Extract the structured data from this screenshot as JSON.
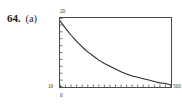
{
  "exercise": {
    "number": "64.",
    "part": "(a)"
  },
  "figure": {
    "y_axis": {
      "max_label": "20",
      "min_label": "10"
    },
    "x_axis": {
      "min_label": "0",
      "max_label": "500"
    },
    "colors": {
      "frame": "#4a4a4a",
      "curve": "#2a2a2a",
      "text": "#1a1a1a",
      "background": "#ffffff"
    }
  },
  "chart_data": {
    "type": "line",
    "title": "",
    "xlabel": "",
    "ylabel": "",
    "xlim": [
      0,
      500
    ],
    "ylim": [
      10,
      20
    ],
    "grid": false,
    "legend": null,
    "x": [
      0,
      25,
      50,
      75,
      100,
      125,
      150,
      175,
      200,
      225,
      250,
      275,
      300,
      325,
      350,
      375,
      400,
      425,
      450,
      475,
      500
    ],
    "y": [
      19.6,
      18.5,
      17.5,
      16.6,
      15.8,
      15.1,
      14.5,
      13.9,
      13.4,
      13.0,
      12.6,
      12.2,
      11.9,
      11.6,
      11.4,
      11.2,
      11.0,
      10.8,
      10.6,
      10.5,
      10.3
    ],
    "x_ticks": [
      0,
      25,
      50,
      75,
      100,
      125,
      150,
      175,
      200,
      225,
      250,
      275,
      300,
      325,
      350,
      375,
      400,
      425,
      450,
      475,
      500
    ],
    "y_ticks": [
      10,
      11,
      12,
      13,
      14,
      15,
      16,
      17,
      18,
      19,
      20
    ]
  }
}
